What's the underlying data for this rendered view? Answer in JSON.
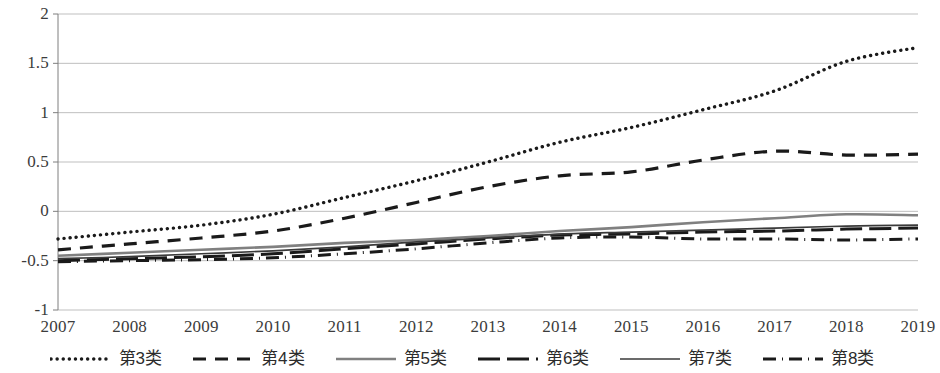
{
  "chart_data": {
    "type": "line",
    "title": "",
    "xlabel": "",
    "ylabel": "",
    "x": [
      2007,
      2008,
      2009,
      2010,
      2011,
      2012,
      2013,
      2014,
      2015,
      2016,
      2017,
      2018,
      2019
    ],
    "categories": [
      "2007",
      "2008",
      "2009",
      "2010",
      "2011",
      "2012",
      "2013",
      "2014",
      "2015",
      "2016",
      "2017",
      "2018",
      "2019"
    ],
    "ylim": [
      -1,
      2
    ],
    "yticks": [
      -1,
      -0.5,
      0,
      0.5,
      1,
      1.5,
      2
    ],
    "ytick_labels": [
      "-1",
      "-0.5",
      "0",
      "0.5",
      "1",
      "1.5",
      "2"
    ],
    "grid": "horizontal",
    "legend_position": "bottom",
    "series": [
      {
        "name": "第3类",
        "style": "dotted",
        "color": "#1a1a1a",
        "values": [
          -0.28,
          -0.21,
          -0.14,
          -0.03,
          0.14,
          0.31,
          0.5,
          0.7,
          0.85,
          1.03,
          1.22,
          1.52,
          1.66
        ]
      },
      {
        "name": "第4类",
        "style": "dashed",
        "color": "#1a1a1a",
        "values": [
          -0.39,
          -0.33,
          -0.27,
          -0.2,
          -0.07,
          0.09,
          0.25,
          0.36,
          0.4,
          0.52,
          0.61,
          0.57,
          0.58
        ]
      },
      {
        "name": "第5类",
        "style": "solid",
        "color": "#808080",
        "values": [
          -0.45,
          -0.42,
          -0.39,
          -0.36,
          -0.32,
          -0.29,
          -0.25,
          -0.2,
          -0.16,
          -0.11,
          -0.07,
          -0.03,
          -0.04
        ]
      },
      {
        "name": "第6类",
        "style": "long-dash",
        "color": "#1a1a1a",
        "values": [
          -0.5,
          -0.48,
          -0.46,
          -0.43,
          -0.38,
          -0.33,
          -0.28,
          -0.24,
          -0.23,
          -0.21,
          -0.2,
          -0.18,
          -0.17
        ]
      },
      {
        "name": "第7类",
        "style": "solid-thin",
        "color": "#3a3a3a",
        "values": [
          -0.48,
          -0.46,
          -0.43,
          -0.4,
          -0.36,
          -0.31,
          -0.27,
          -0.23,
          -0.21,
          -0.19,
          -0.17,
          -0.15,
          -0.14
        ]
      },
      {
        "name": "第8类",
        "style": "dash-dot",
        "color": "#1a1a1a",
        "values": [
          -0.51,
          -0.5,
          -0.49,
          -0.47,
          -0.43,
          -0.38,
          -0.32,
          -0.27,
          -0.26,
          -0.28,
          -0.28,
          -0.29,
          -0.28
        ]
      }
    ]
  },
  "legend": {
    "items": [
      {
        "label": "第3类",
        "style": "dotted"
      },
      {
        "label": "第4类",
        "style": "dashed"
      },
      {
        "label": "第5类",
        "style": "solid"
      },
      {
        "label": "第6类",
        "style": "long-dash"
      },
      {
        "label": "第7类",
        "style": "solid-thin"
      },
      {
        "label": "第8类",
        "style": "dash-dot"
      }
    ]
  },
  "axes": {
    "y_labels": [
      "2",
      "1.5",
      "1",
      "0.5",
      "0",
      "-0.5",
      "-1"
    ],
    "x_labels": [
      "2007",
      "2008",
      "2009",
      "2010",
      "2011",
      "2012",
      "2013",
      "2014",
      "2015",
      "2016",
      "2017",
      "2018",
      "2019"
    ]
  },
  "colors": {
    "gridline": "#bfbfbf",
    "axis_line": "#7f7f7f",
    "line_dark": "#1a1a1a",
    "line_gray": "#808080",
    "text": "#3c3c3c",
    "background": "#ffffff"
  }
}
